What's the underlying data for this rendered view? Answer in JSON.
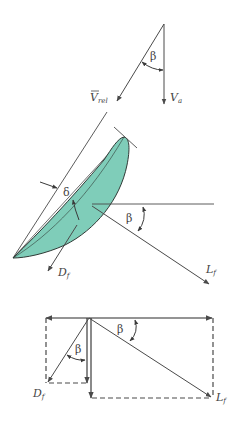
{
  "colors": {
    "line": "#4a4a4a",
    "airfoil_fill": "#7fcdb9",
    "airfoil_stroke": "#2f3a36",
    "background": "#ffffff"
  },
  "velocity_triangle": {
    "angle_label": "β",
    "vrel_label": "V",
    "vrel_subscript": "rel",
    "va_label": "V",
    "va_subscript": "a"
  },
  "blade_diagram": {
    "deviation_label": "δ",
    "angle_label": "β",
    "drag_label": "D",
    "drag_subscript": "f",
    "lift_label": "L",
    "lift_subscript": "f"
  },
  "force_decomposition": {
    "angle_label_left": "β",
    "angle_label_right": "β",
    "drag_label": "D",
    "drag_subscript": "f",
    "lift_label": "L",
    "lift_subscript": "f"
  }
}
